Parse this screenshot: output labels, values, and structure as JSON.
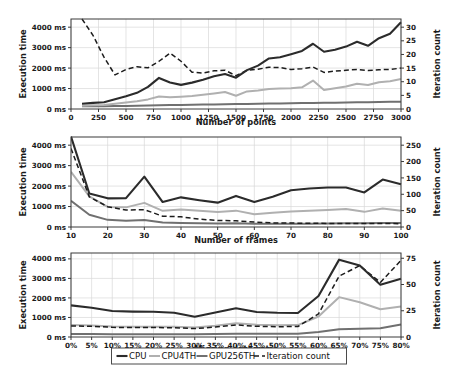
{
  "figure": {
    "title": "",
    "legend": {
      "position": "bottom-center",
      "entries": [
        {
          "label": "CPU",
          "color": "#2b2b2b",
          "style": "solid"
        },
        {
          "label": "CPU4TH",
          "color": "#b0b0b0",
          "style": "solid"
        },
        {
          "label": "GPU256TH",
          "color": "#707070",
          "style": "solid"
        },
        {
          "label": "Iteration count",
          "color": "#1c1c1c",
          "style": "dashed"
        }
      ]
    }
  },
  "chart_data": [
    {
      "type": "line",
      "title": "",
      "xlabel": "Number of points",
      "ylabel": "Execution time",
      "y2label": "Iteration count",
      "grid": true,
      "legend_position": "bottom-center",
      "xlim": [
        0,
        3000
      ],
      "ylim": [
        0,
        4400
      ],
      "y2lim": [
        0,
        33
      ],
      "xticks": [
        0,
        250,
        500,
        750,
        1000,
        1250,
        1500,
        1750,
        2000,
        2250,
        2500,
        2750,
        3000
      ],
      "xticklabels": [
        "0",
        "250",
        "500",
        "750",
        "1000",
        "1250",
        "1500",
        "1750",
        "2000",
        "2250",
        "2500",
        "2750",
        "3000"
      ],
      "yticks": [
        0,
        1000,
        2000,
        3000,
        4000
      ],
      "yticklabels": [
        "0 ms",
        "1000 ms",
        "2000 ms",
        "3000 ms",
        "4000 ms"
      ],
      "y2ticks": [
        0,
        5,
        10,
        15,
        20,
        25,
        30
      ],
      "y2ticklabels": [
        "0",
        "5",
        "10",
        "15",
        "20",
        "25",
        "30"
      ],
      "x": [
        100,
        200,
        300,
        400,
        500,
        600,
        700,
        800,
        900,
        1000,
        1100,
        1200,
        1300,
        1400,
        1500,
        1600,
        1700,
        1800,
        1900,
        2000,
        2100,
        2200,
        2300,
        2400,
        2500,
        2600,
        2700,
        2800,
        2900,
        3000
      ],
      "series": [
        {
          "name": "CPU",
          "axis": "left",
          "values": [
            260,
            300,
            330,
            480,
            620,
            790,
            1080,
            1520,
            1300,
            1180,
            1290,
            1430,
            1600,
            1710,
            1530,
            1900,
            2120,
            2470,
            2530,
            2680,
            2840,
            3190,
            2800,
            2900,
            3050,
            3290,
            3090,
            3460,
            3680,
            4240
          ]
        },
        {
          "name": "CPU4TH",
          "axis": "left",
          "values": [
            160,
            185,
            200,
            260,
            320,
            380,
            470,
            610,
            570,
            600,
            640,
            700,
            760,
            830,
            650,
            860,
            910,
            980,
            1000,
            1020,
            1060,
            1390,
            930,
            1010,
            1100,
            1230,
            1170,
            1310,
            1360,
            1470
          ]
        },
        {
          "name": "GPU256TH",
          "axis": "left",
          "values": [
            130,
            135,
            140,
            145,
            150,
            160,
            170,
            180,
            190,
            200,
            210,
            215,
            225,
            235,
            240,
            250,
            258,
            265,
            272,
            280,
            288,
            295,
            300,
            310,
            318,
            326,
            334,
            342,
            350,
            360
          ]
        },
        {
          "name": "Iteration count",
          "axis": "right",
          "values": [
            33,
            27,
            19,
            12.5,
            14.5,
            15.5,
            15.1,
            17.5,
            20.5,
            17.5,
            13.5,
            13.2,
            14,
            14.2,
            12.2,
            14.2,
            14.6,
            15.3,
            15.2,
            14.5,
            14.8,
            15.4,
            13.4,
            13.9,
            14.2,
            14.5,
            14.1,
            14.4,
            14.5,
            15
          ]
        }
      ]
    },
    {
      "type": "line",
      "title": "",
      "xlabel": "Number of frames",
      "ylabel": "Execution time",
      "y2label": "Iteration count",
      "grid": true,
      "legend_position": "bottom-center",
      "xlim": [
        10,
        100
      ],
      "ylim": [
        0,
        4400
      ],
      "y2lim": [
        0,
        275
      ],
      "xticks": [
        10,
        20,
        30,
        40,
        50,
        60,
        70,
        80,
        90,
        100
      ],
      "xticklabels": [
        "10",
        "20",
        "30",
        "40",
        "50",
        "60",
        "70",
        "80",
        "90",
        "100"
      ],
      "yticks": [
        0,
        1000,
        2000,
        3000,
        4000
      ],
      "yticklabels": [
        "0 ms",
        "1000 ms",
        "2000 ms",
        "3000 ms",
        "4000 ms"
      ],
      "y2ticks": [
        0,
        50,
        100,
        150,
        200,
        250
      ],
      "y2ticklabels": [
        "0",
        "50",
        "100",
        "150",
        "200",
        "250"
      ],
      "x": [
        10,
        15,
        20,
        25,
        30,
        35,
        40,
        45,
        50,
        55,
        60,
        65,
        70,
        75,
        80,
        85,
        90,
        95,
        100
      ],
      "series": [
        {
          "name": "CPU",
          "axis": "left",
          "values": [
            4420,
            1640,
            1400,
            1410,
            2460,
            1220,
            1450,
            1310,
            1190,
            1520,
            1220,
            1480,
            1800,
            1880,
            1930,
            1930,
            1690,
            2320,
            2090
          ]
        },
        {
          "name": "CPU4TH",
          "axis": "left",
          "values": [
            2700,
            1500,
            980,
            960,
            1180,
            790,
            850,
            790,
            730,
            800,
            620,
            700,
            760,
            800,
            830,
            880,
            740,
            900,
            790
          ]
        },
        {
          "name": "GPU256TH",
          "axis": "left",
          "values": [
            1280,
            600,
            350,
            300,
            340,
            220,
            200,
            180,
            170,
            180,
            160,
            155,
            160,
            165,
            175,
            180,
            180,
            200,
            200
          ]
        },
        {
          "name": "Iteration count",
          "axis": "right",
          "values": [
            240,
            92,
            62,
            52,
            53,
            33,
            31,
            24,
            20,
            19,
            15,
            12.5,
            12,
            11.5,
            11,
            11,
            10.5,
            11,
            10
          ]
        }
      ]
    },
    {
      "type": "line",
      "title": "",
      "xlabel": "Missing data ratio",
      "ylabel": "Execution time",
      "y2label": "Iteration count",
      "grid": true,
      "legend_position": "bottom-center",
      "xlim": [
        0,
        80
      ],
      "ylim": [
        0,
        4300
      ],
      "y2lim": [
        0,
        80
      ],
      "xticks": [
        0,
        5,
        10,
        15,
        20,
        25,
        30,
        35,
        40,
        45,
        50,
        55,
        60,
        65,
        70,
        75,
        80
      ],
      "xticklabels": [
        "0%",
        "5%",
        "10%",
        "15%",
        "20%",
        "25%",
        "30%",
        "35%",
        "40%",
        "45%",
        "50%",
        "55%",
        "60%",
        "65%",
        "70%",
        "75%",
        "80%"
      ],
      "yticks": [
        0,
        1000,
        2000,
        3000,
        4000
      ],
      "yticklabels": [
        "0 ms",
        "1000 ms",
        "2000 ms",
        "3000 ms",
        "4000 ms"
      ],
      "y2ticks": [
        0,
        25,
        50,
        75
      ],
      "y2ticklabels": [
        "0",
        "25",
        "50",
        "75"
      ],
      "x": [
        0,
        5,
        10,
        15,
        20,
        25,
        30,
        35,
        40,
        45,
        50,
        55,
        60,
        65,
        70,
        75,
        80
      ],
      "series": [
        {
          "name": "CPU",
          "axis": "left",
          "values": [
            1620,
            1500,
            1330,
            1300,
            1290,
            1240,
            1040,
            1250,
            1470,
            1280,
            1240,
            1230,
            2100,
            3960,
            3660,
            2680,
            2980
          ]
        },
        {
          "name": "CPU4TH",
          "axis": "left",
          "values": [
            620,
            590,
            540,
            530,
            530,
            520,
            490,
            580,
            700,
            630,
            600,
            610,
            1050,
            2040,
            1780,
            1420,
            1560
          ]
        },
        {
          "name": "GPU256TH",
          "axis": "left",
          "values": [
            150,
            150,
            145,
            145,
            145,
            145,
            140,
            150,
            160,
            160,
            165,
            170,
            260,
            400,
            420,
            450,
            640
          ]
        },
        {
          "name": "Iteration count",
          "axis": "right",
          "values": [
            10.5,
            10.2,
            9.2,
            9.0,
            9.0,
            8.8,
            8.0,
            9.5,
            11.5,
            10.2,
            9.8,
            10.0,
            22,
            58,
            68,
            52,
            73
          ]
        }
      ]
    }
  ]
}
